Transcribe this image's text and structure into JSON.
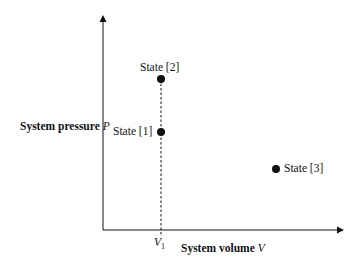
{
  "diagram": {
    "type": "pressure-volume state diagram",
    "axes": {
      "y_label": "System pressure",
      "y_symbol": "P",
      "x_label": "System volume",
      "x_symbol": "V",
      "x_tick_label": "V",
      "x_tick_subscript": "1"
    },
    "states": [
      {
        "id": "state-1",
        "label": "State [1]",
        "x": 161,
        "y": 132,
        "label_position": "left"
      },
      {
        "id": "state-2",
        "label": "State [2]",
        "x": 161,
        "y": 79,
        "label_position": "above"
      },
      {
        "id": "state-3",
        "label": "State [3]",
        "x": 276,
        "y": 169,
        "label_position": "right"
      }
    ],
    "guide_line": {
      "style": "dashed",
      "at": "V1",
      "from_state": "State [2]",
      "to": "x-axis"
    },
    "colors": {
      "ink": "#111111",
      "background": "#ffffff"
    }
  }
}
